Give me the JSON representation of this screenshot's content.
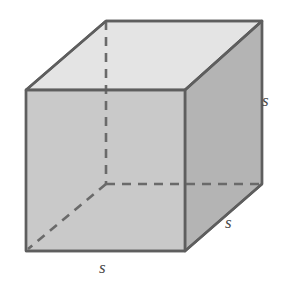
{
  "figure": {
    "name": "cube-diagram",
    "shape": "cube",
    "projection": "oblique",
    "labels": [
      {
        "id": "right",
        "text": "s",
        "position": "right-vertical-edge"
      },
      {
        "id": "depth",
        "text": "s",
        "position": "bottom-right-depth-edge"
      },
      {
        "id": "bottom",
        "text": "s",
        "position": "front-bottom-edge"
      }
    ],
    "colors": {
      "top_face": "#e4e4e4",
      "front_face": "#c9c9c9",
      "right_face": "#b4b4b4",
      "edge_stroke": "#5e5e5e",
      "hidden_edge_stroke": "#6a6a6a",
      "label_text": "#4a4a4a",
      "background": "#ffffff"
    },
    "geometry": {
      "front_top_left": [
        26,
        90
      ],
      "front_top_right": [
        185,
        90
      ],
      "front_bottom_right": [
        185,
        251
      ],
      "front_bottom_left": [
        26,
        251
      ],
      "back_top_left": [
        106,
        21
      ],
      "back_top_right": [
        262,
        21
      ],
      "back_bottom_right": [
        262,
        184
      ],
      "hidden_back_bottom_left": [
        106,
        184
      ],
      "depth_offset": [
        78,
        -68
      ]
    },
    "edges": {
      "visible": [
        "front-top-left-to-front-top-right",
        "front-top-right-to-front-bottom-right",
        "front-bottom-right-to-front-bottom-left",
        "front-bottom-left-to-front-top-left",
        "back-top-left-to-back-top-right",
        "back-top-right-to-back-bottom-right",
        "front-top-left-to-back-top-left",
        "front-top-right-to-back-top-right",
        "front-bottom-right-to-back-bottom-right"
      ],
      "hidden": [
        "back-top-left-to-hidden-back-bottom-left",
        "hidden-back-bottom-left-to-back-bottom-right",
        "hidden-back-bottom-left-to-front-bottom-left"
      ]
    },
    "top_artifact": {
      "text": ""
    }
  }
}
